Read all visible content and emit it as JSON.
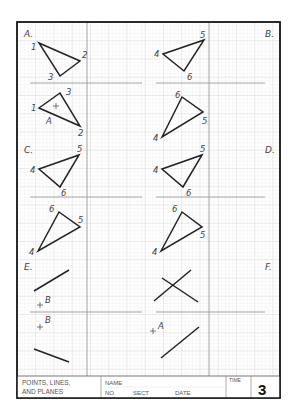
{
  "sheet": {
    "title_block": {
      "title_line1": "POINTS, LINES,",
      "title_line2": "AND PLANES",
      "name_label": "NAME",
      "no_label": "NO.",
      "sect_label": "SECT",
      "date_label": "DATE",
      "time_label": "TIME",
      "sheet_number": "3"
    },
    "sections": {
      "A": "A.",
      "B": "B.",
      "C": "C.",
      "D": "D.",
      "E": "E.",
      "F": "F."
    },
    "problems": {
      "A_top": {
        "p1": "1",
        "p2": "2",
        "p3": "3"
      },
      "B_top": {
        "p4": "4",
        "p5": "5",
        "p6": "6"
      },
      "A_bottom": {
        "p1": "1",
        "p2": "2",
        "p3": "3",
        "point": "A"
      },
      "B_bottom": {
        "p4": "4",
        "p5": "5",
        "p6": "6"
      },
      "C_top": {
        "p4": "4",
        "p5": "5",
        "p6": "6"
      },
      "D_top": {
        "p4": "4",
        "p5": "5",
        "p6": "6"
      },
      "C_bottom": {
        "p4": "4",
        "p5": "5",
        "p6": "6"
      },
      "D_bottom": {
        "p4": "4",
        "p5": "5",
        "p6": "6"
      },
      "E_top": {
        "point": "B"
      },
      "E_bottom": {
        "point": "B"
      },
      "F_bottom": {
        "point": "A"
      }
    },
    "colors": {
      "ink": "#222222",
      "grid_fine": "#e4e4e4",
      "grid_major": "#cfcfcf",
      "divider": "#9a9a9a",
      "label": "#444444"
    }
  }
}
